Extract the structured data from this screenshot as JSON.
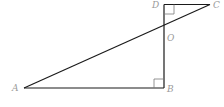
{
  "diagram": {
    "type": "geometry",
    "points": {
      "A": {
        "label": "A",
        "x": 24,
        "y": 88
      },
      "B": {
        "label": "B",
        "x": 164,
        "y": 88
      },
      "C": {
        "label": "C",
        "x": 210,
        "y": 4.5
      },
      "D": {
        "label": "D",
        "x": 164,
        "y": 4.5
      },
      "O": {
        "label": "O",
        "x": 164,
        "y": 25.2
      }
    },
    "segments": [
      "AB",
      "BD",
      "DC",
      "AC"
    ],
    "right_angles": [
      "B",
      "D"
    ],
    "colors": {
      "line": "#1a1a1a",
      "label": "#9a9a9a",
      "marker": "#7a7a7a"
    }
  }
}
